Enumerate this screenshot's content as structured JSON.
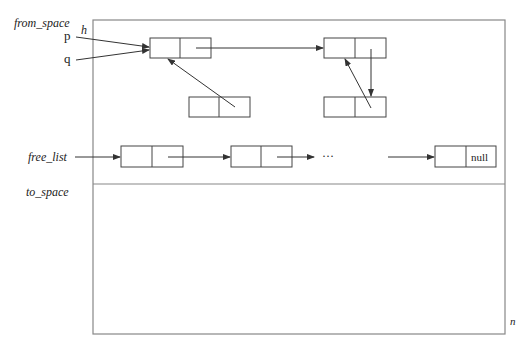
{
  "diagram": {
    "type": "memory-layout",
    "regions": {
      "from_space": "from_space",
      "to_space": "to_space"
    },
    "markers": {
      "h": "h",
      "n": "n"
    },
    "pointers": {
      "p": "p",
      "q": "q",
      "free_list": "free_list"
    },
    "free_list_ellipsis": "···",
    "null_label": "null",
    "colors": {
      "line": "#555555",
      "frame": "#888888",
      "text": "#222222"
    }
  }
}
